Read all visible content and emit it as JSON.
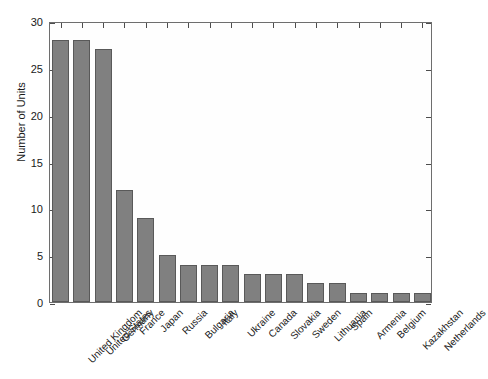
{
  "chart_data": {
    "type": "bar",
    "title": "",
    "subtitle": "",
    "xlabel": "",
    "ylabel": "Number of Units",
    "ylim": [
      0,
      30
    ],
    "yticks": [
      0,
      5,
      10,
      15,
      20,
      25,
      30
    ],
    "ytick_labels": [
      "0",
      "5",
      "10",
      "15",
      "20",
      "25",
      "30"
    ],
    "grid": false,
    "legend": null,
    "bar_color": "#808080",
    "bar_edge_color": "#595959",
    "axis_color": "#6e6e6e",
    "categories": [
      "United Kingdom",
      "United States",
      "Germany",
      "France",
      "Japan",
      "Russia",
      "Bulgaria",
      "Italy",
      "Ukraine",
      "Canada",
      "Slovakia",
      "Sweden",
      "Lithuania",
      "Spain",
      "Armenia",
      "Belgium",
      "Kazakhstan",
      "Netherlands"
    ],
    "values": [
      28,
      28,
      27,
      12,
      9,
      5,
      4,
      4,
      4,
      3,
      3,
      3,
      2,
      2,
      1,
      1,
      1,
      1
    ]
  }
}
